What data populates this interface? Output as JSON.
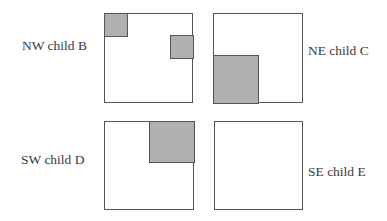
{
  "diagram": {
    "type": "quadtree-children",
    "colors": {
      "border": "#555555",
      "fill": "#b0b0b0",
      "background": "#ffffff"
    },
    "quadrants": [
      {
        "id": "nw",
        "label": "NW child B",
        "position": "top-left",
        "shaded_regions": [
          {
            "corner": "top-left",
            "size": "small"
          },
          {
            "corner": "right-edge-upper",
            "size": "small"
          }
        ]
      },
      {
        "id": "ne",
        "label": "NE child C",
        "position": "top-right",
        "shaded_regions": [
          {
            "corner": "bottom-left",
            "size": "half"
          }
        ]
      },
      {
        "id": "sw",
        "label": "SW child D",
        "position": "bottom-left",
        "shaded_regions": [
          {
            "corner": "top-right",
            "size": "half"
          }
        ]
      },
      {
        "id": "se",
        "label": "SE child E",
        "position": "bottom-right",
        "shaded_regions": []
      }
    ]
  }
}
